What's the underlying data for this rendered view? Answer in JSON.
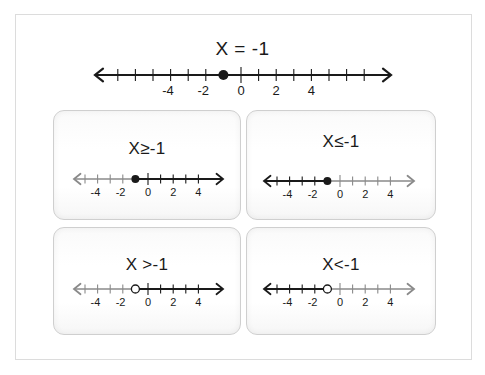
{
  "main": {
    "title": "X = -1",
    "number_line": {
      "min": -7,
      "max": 7,
      "point": -1,
      "point_type": "closed",
      "shade": "none",
      "labels": [
        -4,
        -2,
        0,
        2,
        4
      ]
    }
  },
  "cards": [
    {
      "title": "X≥-1",
      "inequality": "greater-equal",
      "point": -1,
      "point_type": "closed",
      "shade": "right",
      "min": -5,
      "max": 4,
      "labels": [
        -4,
        -2,
        0,
        2,
        4
      ]
    },
    {
      "title": "X≤-1",
      "inequality": "less-equal",
      "point": -1,
      "point_type": "closed",
      "shade": "left",
      "min": -5,
      "max": 4,
      "labels": [
        -4,
        -2,
        0,
        2,
        4
      ]
    },
    {
      "title": "X >-1",
      "inequality": "greater-than",
      "point": -1,
      "point_type": "open",
      "shade": "right",
      "min": -5,
      "max": 4,
      "labels": [
        -4,
        -2,
        0,
        2,
        4
      ]
    },
    {
      "title": "X<-1",
      "inequality": "less-than",
      "point": -1,
      "point_type": "open",
      "shade": "left",
      "min": -5,
      "max": 4,
      "labels": [
        -4,
        -2,
        0,
        2,
        4
      ]
    }
  ],
  "colors": {
    "line_dark": "#1a1a1a",
    "line_light": "#8a8a8a",
    "card_border": "#cfcfcf",
    "frame_border": "#dcdcdc"
  },
  "chart_data": {
    "type": "number-line",
    "title": "X = -1",
    "xlim": [
      -7,
      7
    ],
    "tick_labels": [
      -4,
      -2,
      0,
      2,
      4
    ],
    "panels": [
      {
        "label": "X = -1",
        "point": -1,
        "endpoint": "closed",
        "direction": "none"
      },
      {
        "label": "X≥-1",
        "point": -1,
        "endpoint": "closed",
        "direction": "right"
      },
      {
        "label": "X≤-1",
        "point": -1,
        "endpoint": "closed",
        "direction": "left"
      },
      {
        "label": "X >-1",
        "point": -1,
        "endpoint": "open",
        "direction": "right"
      },
      {
        "label": "X<-1",
        "point": -1,
        "endpoint": "open",
        "direction": "left"
      }
    ]
  }
}
